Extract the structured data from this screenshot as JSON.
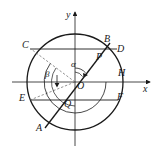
{
  "figure": {
    "type": "geometry-diagram",
    "background_color": "#ffffff",
    "stroke_color": "#1a1a1a",
    "dashed_color": "#666666"
  },
  "axes": {
    "x_label": "x",
    "y_label": "y",
    "origin_label": "O"
  },
  "points": [
    {
      "id": "C",
      "label": "C",
      "x": 30,
      "y": 48,
      "label_x": 22,
      "label_y": 42
    },
    {
      "id": "B",
      "label": "B",
      "x": 108,
      "y": 45,
      "label_x": 105,
      "label_y": 37
    },
    {
      "id": "D",
      "label": "D",
      "x": 116,
      "y": 52,
      "label_x": 117,
      "label_y": 46
    },
    {
      "id": "P",
      "label": "P",
      "x": 101,
      "y": 57,
      "label_x": 98,
      "label_y": 55
    },
    {
      "id": "H",
      "label": "H",
      "x": 123,
      "y": 78,
      "label_x": 119,
      "label_y": 70
    },
    {
      "id": "E",
      "label": "E",
      "x": 29,
      "y": 100,
      "label_x": 21,
      "label_y": 95
    },
    {
      "id": "F",
      "label": "F",
      "x": 117,
      "y": 100,
      "label_x": 117,
      "label_y": 94
    },
    {
      "id": "Q",
      "label": "Q",
      "x": 70,
      "y": 100,
      "label_x": 66,
      "label_y": 100
    },
    {
      "id": "A",
      "label": "A",
      "x": 45,
      "y": 127,
      "label_x": 37,
      "label_y": 125
    },
    {
      "id": "O",
      "label": "O",
      "x": 75,
      "y": 82,
      "label_x": 77,
      "label_y": 84
    }
  ],
  "angles": [
    {
      "id": "alpha",
      "label": "α",
      "label_x": 72,
      "label_y": 64
    },
    {
      "id": "beta",
      "label": "β",
      "label_x": 47,
      "label_y": 73
    }
  ],
  "circle": {
    "center_x": 75,
    "center_y": 82,
    "radius": 48
  },
  "chords": [
    {
      "id": "CD",
      "from": "C",
      "to": "D"
    },
    {
      "id": "EF",
      "from": "E",
      "to": "F"
    }
  ],
  "lines": [
    {
      "id": "AB",
      "from": "A",
      "to": "B",
      "style": "solid"
    },
    {
      "id": "OC",
      "from": "O",
      "to": "C",
      "style": "dashed"
    },
    {
      "id": "OE",
      "from": "O",
      "to": "E",
      "style": "dashed"
    }
  ]
}
